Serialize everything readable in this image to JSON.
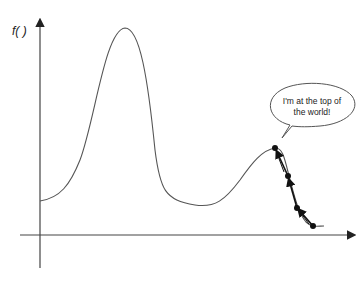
{
  "diagram": {
    "y_axis_label": "f( )",
    "speech_bubble": {
      "line1": "I'm at the top of",
      "line2": "the world!"
    },
    "curve": "function with a tall global maximum and a lower local maximum",
    "path_points": 4,
    "colors": {
      "curve": "#555555",
      "axis": "#444444",
      "path": "#111111"
    }
  }
}
